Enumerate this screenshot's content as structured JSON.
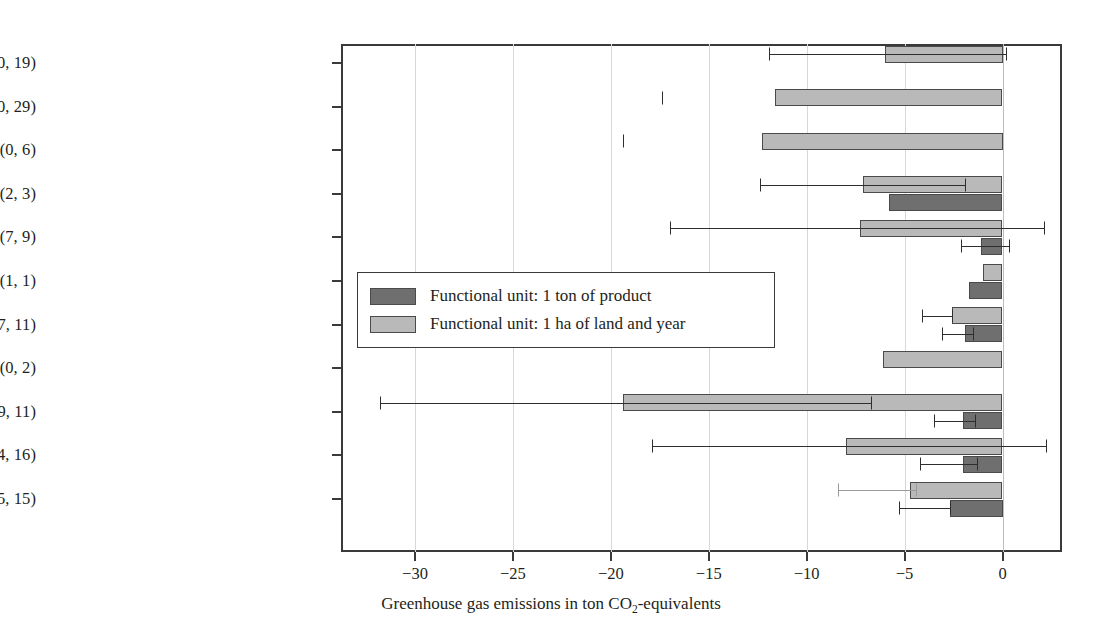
{
  "chart_data": {
    "type": "bar",
    "orientation": "horizontal",
    "title": "",
    "xlabel": "Greenhouse gas emissions in ton CO2-equivalents",
    "xlabel_parts": {
      "before": "Greenhouse gas emissions in ton CO",
      "sub": "2",
      "after": "-equivalents"
    },
    "ylabel": "",
    "xlim": [
      -33.5,
      3.1
    ],
    "xticks": [
      -30,
      -25,
      -20,
      -15,
      -10,
      -5,
      0
    ],
    "xtick_labels": [
      "−30",
      "−25",
      "−20",
      "−15",
      "−10",
      "−5",
      "0"
    ],
    "grid": "vertical",
    "legend_position": "center-left-inside",
    "categories": [
      "Biofuels (0, 19)",
      "Bioenergy (0, 29)",
      "Floorboarding (0, 6)",
      "Lacquer and paints (2, 3)",
      "Composites (7, 9)",
      "Rubber (1, 1)",
      "Hydraulic oils and lubricants (7, 11)",
      "Insulation materials (0, 2)",
      "Surfactants (9, 11)",
      "Plastics (24, 16)",
      "Textiles (15, 15)"
    ],
    "series": [
      {
        "name": "Functional unit: 1 ton of product",
        "color": "#6f6f6f",
        "values": [
          null,
          null,
          null,
          -5.8,
          -1.1,
          -1.7,
          -1.9,
          null,
          -2.0,
          -2.0,
          -2.7
        ],
        "err_low": [
          null,
          null,
          null,
          null,
          -2.1,
          null,
          -3.1,
          null,
          -3.5,
          -4.2,
          -5.3
        ],
        "err_high": [
          null,
          null,
          null,
          null,
          0.35,
          null,
          -1.5,
          null,
          -1.4,
          -1.3,
          -2.7
        ]
      },
      {
        "name": "Functional unit: 1 ha of land and year",
        "color": "#b9b9b9",
        "values": [
          -6.0,
          -11.6,
          -12.3,
          -7.1,
          -7.3,
          -1.0,
          -2.6,
          -6.1,
          -19.4,
          -8.0,
          -4.7
        ],
        "err_low": [
          -11.9,
          -17.4,
          -19.4,
          -12.4,
          -17.0,
          null,
          -4.1,
          null,
          -31.8,
          -17.9,
          -8.4
        ],
        "err_high": [
          0.2,
          null,
          null,
          -1.9,
          2.1,
          null,
          -2.6,
          null,
          -6.7,
          2.2,
          -4.4
        ]
      }
    ]
  },
  "legend": {
    "items": [
      {
        "label": "Functional unit: 1 ton of product",
        "color": "#6f6f6f"
      },
      {
        "label": "Functional unit: 1 ha of land and year",
        "color": "#b9b9b9"
      }
    ]
  }
}
